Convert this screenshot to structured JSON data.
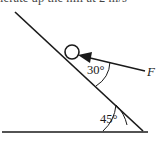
{
  "figure": {
    "kind": "physics-free-body-diagram",
    "background_color": "#ffffff",
    "stroke_color": "#1a1a1a",
    "cropped_text_top": "lerate up the hill at 2 m/s",
    "labels": {
      "incline_angle": "30°",
      "ground_angle": "45°",
      "force": "F"
    },
    "elements": {
      "ball": "circle on incline",
      "incline_line": "ramp surface",
      "ground_line": "horizontal ground",
      "force_arrow": "arrow pointing up-left into ball",
      "arc_30": "angle arc between force arrow and incline",
      "arc_45": "angle arc between ground and incline"
    }
  }
}
